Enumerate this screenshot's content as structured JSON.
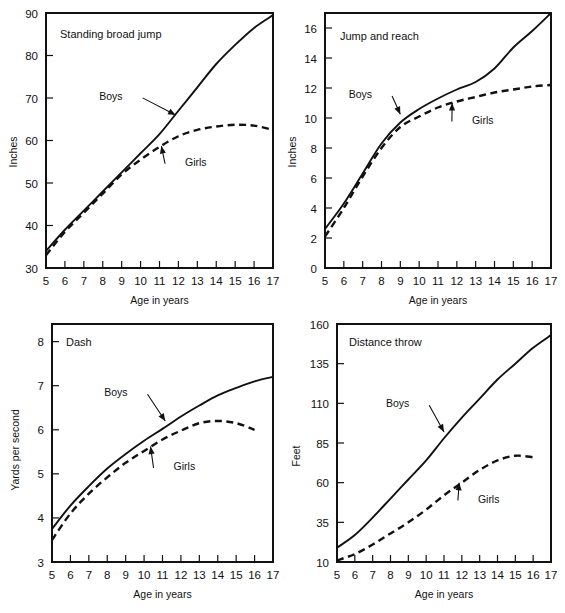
{
  "figure": {
    "background": "#ffffff",
    "ink": "#111111",
    "panel_count": 4
  },
  "chart_data": [
    {
      "type": "line",
      "title": "Standing broad jump",
      "xlabel": "Age in years",
      "ylabel": "Inches",
      "xlim": [
        5,
        17
      ],
      "ylim": [
        30,
        90
      ],
      "xticks": [
        5,
        6,
        7,
        8,
        9,
        10,
        11,
        12,
        13,
        14,
        15,
        16,
        17
      ],
      "xtick_labels": [
        "5",
        "6",
        "7",
        "8",
        "9",
        "10",
        "11",
        "12",
        "13",
        "14",
        "15",
        "16",
        "17"
      ],
      "yticks": [
        30,
        40,
        50,
        60,
        70,
        80,
        90
      ],
      "ytick_labels": [
        "30",
        "40",
        "50",
        "60",
        "70",
        "80",
        "90"
      ],
      "grid": false,
      "legend": "inline-annotations",
      "x": [
        5,
        6,
        7,
        8,
        9,
        10,
        11,
        12,
        13,
        14,
        15,
        16,
        17
      ],
      "series": [
        {
          "name": "Boys",
          "style": "solid",
          "values": [
            34,
            39,
            43.5,
            48,
            52.5,
            57,
            61.5,
            67,
            72.5,
            78,
            82.5,
            86.5,
            89.5
          ],
          "label_x": 9.05,
          "label_y": 70.5,
          "arrow_to_x": 11.85,
          "arrow_to_y": 66.0
        },
        {
          "name": "Girls",
          "style": "dashed",
          "values": [
            33,
            38.5,
            43,
            47.5,
            52,
            55.5,
            58.5,
            61,
            62.5,
            63.3,
            63.7,
            63.5,
            62.5
          ],
          "label_x": 12.35,
          "label_y": 55.0,
          "arrow_to_x": 11.1,
          "arrow_to_y": 58.7
        }
      ]
    },
    {
      "type": "line",
      "title": "Jump and reach",
      "xlabel": "Age in years",
      "ylabel": "Inches",
      "xlim": [
        5,
        17
      ],
      "ylim": [
        0,
        17
      ],
      "xticks": [
        5,
        6,
        7,
        8,
        9,
        10,
        11,
        12,
        13,
        14,
        15,
        16,
        17
      ],
      "xtick_labels": [
        "5",
        "6",
        "7",
        "8",
        "9",
        "10",
        "11",
        "12",
        "13",
        "14",
        "15",
        "16",
        "17"
      ],
      "yticks": [
        0,
        2,
        4,
        6,
        8,
        10,
        12,
        14,
        16
      ],
      "ytick_labels": [
        "0",
        "2",
        "4",
        "6",
        "8",
        "10",
        "12",
        "14",
        "16"
      ],
      "grid": false,
      "legend": "inline-annotations",
      "x": [
        5,
        6,
        7,
        8,
        9,
        10,
        11,
        12,
        13,
        14,
        15,
        16,
        17
      ],
      "series": [
        {
          "name": "Boys",
          "style": "solid",
          "values": [
            2.6,
            4.3,
            6.3,
            8.3,
            9.7,
            10.6,
            11.3,
            11.9,
            12.4,
            13.3,
            14.7,
            15.8,
            17.0
          ],
          "label_x": 7.5,
          "label_y": 11.6,
          "arrow_to_x": 9.0,
          "arrow_to_y": 10.25
        },
        {
          "name": "Girls",
          "style": "dashed",
          "values": [
            2.1,
            4.0,
            6.1,
            8.0,
            9.4,
            10.1,
            10.7,
            11.1,
            11.4,
            11.7,
            11.9,
            12.1,
            12.2
          ],
          "label_x": 12.8,
          "label_y": 9.9,
          "arrow_to_x": 11.75,
          "arrow_to_y": 11.0
        }
      ]
    },
    {
      "type": "line",
      "title": "Dash",
      "xlabel": "Age in years",
      "ylabel": "Yards per second",
      "xlim": [
        5,
        17
      ],
      "ylim": [
        3,
        8.4
      ],
      "xticks": [
        5,
        6,
        7,
        8,
        9,
        10,
        11,
        12,
        13,
        14,
        15,
        16,
        17
      ],
      "xtick_labels": [
        "5",
        "6",
        "7",
        "8",
        "9",
        "10",
        "11",
        "12",
        "13",
        "14",
        "15",
        "16",
        "17"
      ],
      "yticks": [
        3,
        4,
        5,
        6,
        7,
        8
      ],
      "ytick_labels": [
        "3",
        "4",
        "5",
        "6",
        "7",
        "8"
      ],
      "grid": false,
      "legend": "inline-annotations",
      "x": [
        5,
        6,
        7,
        8,
        9,
        10,
        11,
        12,
        13,
        14,
        15,
        16,
        17
      ],
      "series": [
        {
          "name": "Boys",
          "style": "solid",
          "values": [
            3.75,
            4.28,
            4.72,
            5.12,
            5.45,
            5.75,
            6.02,
            6.3,
            6.55,
            6.78,
            6.95,
            7.1,
            7.2
          ],
          "label_x": 9.1,
          "label_y": 6.85,
          "arrow_to_x": 11.15,
          "arrow_to_y": 6.2
        },
        {
          "name": "Girls",
          "style": "dashed",
          "values": [
            3.5,
            4.1,
            4.55,
            4.92,
            5.25,
            5.52,
            5.78,
            5.98,
            6.15,
            6.2,
            6.15,
            6.0
          ],
          "x": [
            5,
            6,
            7,
            8,
            9,
            10,
            11,
            12,
            13,
            14,
            15,
            16
          ],
          "label_x": 11.6,
          "label_y": 5.18,
          "arrow_to_x": 10.35,
          "arrow_to_y": 5.62
        }
      ]
    },
    {
      "type": "line",
      "title": "Distance throw",
      "xlabel": "Age in years",
      "ylabel": "Feet",
      "xlim": [
        5,
        17
      ],
      "ylim": [
        10,
        160
      ],
      "xticks": [
        5,
        6,
        7,
        8,
        9,
        10,
        11,
        12,
        13,
        14,
        15,
        16,
        17
      ],
      "xtick_labels": [
        "5",
        "6",
        "7",
        "8",
        "9",
        "10",
        "11",
        "12",
        "13",
        "14",
        "15",
        "16",
        "17"
      ],
      "yticks": [
        10,
        35,
        60,
        85,
        110,
        135,
        160
      ],
      "ytick_labels": [
        "10",
        "35",
        "60",
        "85",
        "110",
        "135",
        "160"
      ],
      "grid": false,
      "legend": "inline-annotations",
      "x": [
        5,
        6,
        7,
        8,
        9,
        10,
        11,
        12,
        13,
        14,
        15,
        16,
        17
      ],
      "series": [
        {
          "name": "Boys",
          "style": "solid",
          "values": [
            19,
            27,
            38,
            50,
            62,
            74,
            88,
            101,
            113,
            125,
            135,
            145,
            153
          ],
          "label_x": 9.05,
          "label_y": 110,
          "arrow_to_x": 11.0,
          "arrow_to_y": 92
        },
        {
          "name": "Girls",
          "style": "dashed",
          "values": [
            11,
            15,
            21,
            28,
            35,
            43,
            52,
            60,
            68,
            74,
            77,
            76
          ],
          "x": [
            5,
            6,
            7,
            8,
            9,
            10,
            11,
            12,
            13,
            14,
            15,
            16
          ],
          "label_x": 12.9,
          "label_y": 50,
          "arrow_to_x": 11.85,
          "arrow_to_y": 60
        }
      ]
    }
  ]
}
